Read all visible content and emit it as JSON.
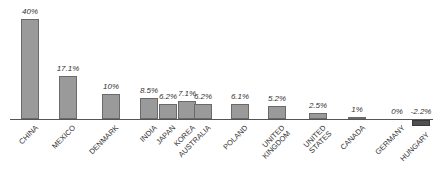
{
  "chart_data": {
    "type": "bar",
    "title": "",
    "xlabel": "",
    "ylabel": "",
    "categories": [
      "CHINA",
      "MEXICO",
      "DENMARK",
      "INDIA",
      "KOREA",
      "JAPAN",
      "AUSTRALIA",
      "POLAND",
      "UNITED KINGDOM",
      "UNITED STATES",
      "CANADA",
      "GERMANY",
      "HUNGARY"
    ],
    "values": [
      40,
      17.1,
      10,
      8.5,
      7.1,
      6.2,
      6.2,
      6.1,
      5.2,
      2.5,
      1,
      0,
      -2.2
    ],
    "labels": [
      "40%",
      "17.1%",
      "10%",
      "8.5%",
      "7.1%",
      "6.2%",
      "6.2%",
      "6.1%",
      "5.2%",
      "2.5%",
      "1%",
      "0%",
      "-2.2%"
    ],
    "ylim": [
      -2.2,
      40
    ],
    "grid": false,
    "legend": null
  },
  "colors": {
    "positive_bar": "#9a9a9a",
    "negative_bar": "#505050",
    "axis": "#555555"
  }
}
